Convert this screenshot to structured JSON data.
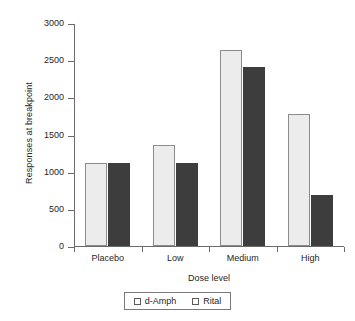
{
  "chart_data": {
    "type": "bar",
    "title": "",
    "subtitle": "",
    "xlabel": "Dose level",
    "ylabel": "Responses at breakpoint",
    "categories": [
      "Placebo",
      "Low",
      "Medium",
      "High"
    ],
    "series": [
      {
        "name": "d-Amph",
        "values": [
          1115,
          1358,
          2638,
          1778
        ],
        "color": "#ececec"
      },
      {
        "name": "Rital",
        "values": [
          1115,
          1118,
          2408,
          688
        ],
        "color": "#3d3d3d"
      }
    ],
    "ylim": [
      0,
      3000
    ],
    "yticks": [
      0,
      500,
      1000,
      1500,
      2000,
      2500,
      3000
    ],
    "ytick_labels": [
      "0",
      "500",
      "1000",
      "1500",
      "2000",
      "2500",
      "3000"
    ],
    "grid": false,
    "legend_position": "bottom"
  },
  "legend": {
    "entries": [
      {
        "label": "d-Amph"
      },
      {
        "label": "Rital"
      }
    ]
  },
  "axes": {
    "y_title": "Responses at breakpoint",
    "x_title": "Dose level"
  }
}
